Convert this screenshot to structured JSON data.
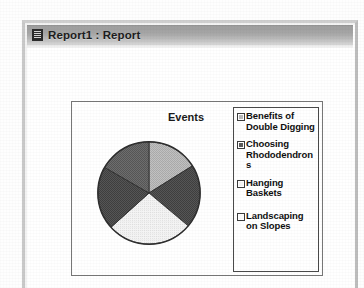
{
  "window": {
    "title": "Report1 : Report",
    "icon": "report-document-icon"
  },
  "chart": {
    "title": "Events"
  },
  "chart_data": {
    "type": "pie",
    "title": "Events",
    "legend_position": "right",
    "categories": [
      "Benefits of Double Digging",
      "Choosing Rhododendrons",
      "Hanging Baskets",
      "Landscaping on Slopes",
      "Pruning Basics"
    ],
    "values": [
      20,
      20,
      20,
      20,
      20
    ],
    "colors": [
      "#b9b9b9",
      "#5a5a5a",
      "#f0f0f0",
      "#4e4e4e",
      "#6e6e6e"
    ],
    "slices": [
      {
        "label": "Benefits of Double Digging",
        "value": 20,
        "start_deg": 0,
        "end_deg": 58,
        "color": "#b9b9b9"
      },
      {
        "label": "Choosing Rhododendrons",
        "value": 20,
        "start_deg": 58,
        "end_deg": 130,
        "color": "#5a5a5a"
      },
      {
        "label": "Hanging Baskets",
        "value": 20,
        "start_deg": 130,
        "end_deg": 228,
        "color": "#f0f0f0"
      },
      {
        "label": "Landscaping on Slopes",
        "value": 20,
        "start_deg": 228,
        "end_deg": 300,
        "color": "#4e4e4e"
      },
      {
        "label": "Pruning Basics",
        "value": 20,
        "start_deg": 300,
        "end_deg": 360,
        "color": "#6e6e6e"
      }
    ]
  },
  "legend": {
    "items": [
      {
        "label": "Benefits of Double Digging",
        "color": "#b9b9b9"
      },
      {
        "label": "Choosing Rhododendrons",
        "color": "#5a5a5a"
      },
      {
        "label": "Hanging Baskets",
        "color": "#f4f4f4"
      },
      {
        "label": "Landscaping on Slopes",
        "color": "#fbfbfb"
      }
    ]
  }
}
